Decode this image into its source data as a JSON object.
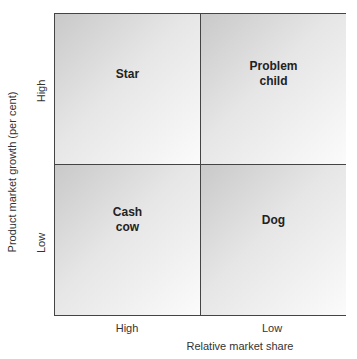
{
  "diagram": {
    "type": "2x2 matrix",
    "quadrants": [
      {
        "position": "top-left",
        "label": "Star"
      },
      {
        "position": "top-right",
        "label": "Problem\nchild"
      },
      {
        "position": "bottom-left",
        "label": "Cash\ncow"
      },
      {
        "position": "bottom-right",
        "label": "Dog"
      }
    ],
    "x_axis": {
      "label": "Relative market share",
      "ticks": [
        "High",
        "Low"
      ]
    },
    "y_axis": {
      "label": "Product market growth (per cent)",
      "ticks": [
        "High",
        "Low"
      ]
    }
  }
}
